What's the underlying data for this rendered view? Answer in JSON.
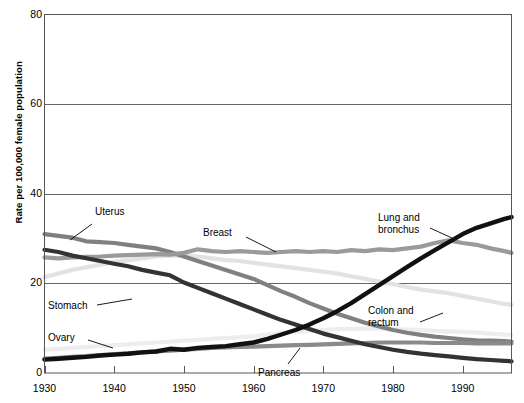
{
  "chart_data": {
    "type": "line",
    "title": "",
    "xlabel": "",
    "ylabel": "Rate per 100,000 female population",
    "xlim": [
      1930,
      1997
    ],
    "ylim": [
      0,
      80
    ],
    "grid": true,
    "legend_position": "inline-annotations",
    "xticks": [
      1930,
      1940,
      1950,
      1960,
      1970,
      1980,
      1990
    ],
    "yticks": [
      0,
      20,
      40,
      60,
      80
    ],
    "xtick_labels": [
      "1930",
      "1940",
      "1950",
      "1960",
      "1970",
      "1980",
      "1990"
    ],
    "ytick_labels": [
      "0",
      "20",
      "40",
      "60",
      "80"
    ],
    "x": [
      1930,
      1932,
      1934,
      1936,
      1938,
      1940,
      1942,
      1944,
      1946,
      1948,
      1950,
      1952,
      1954,
      1956,
      1958,
      1960,
      1962,
      1964,
      1966,
      1968,
      1970,
      1972,
      1974,
      1976,
      1978,
      1980,
      1982,
      1984,
      1986,
      1988,
      1990,
      1992,
      1994,
      1996,
      1997
    ],
    "series": [
      {
        "name": "Uterus",
        "color": "#808080",
        "width": 4.2,
        "values": [
          31.0,
          30.6,
          30.2,
          29.4,
          29.2,
          29.0,
          28.6,
          28.2,
          27.8,
          27.0,
          26.0,
          25.0,
          24.0,
          23.0,
          22.0,
          21.0,
          19.6,
          18.2,
          17.0,
          15.6,
          14.4,
          13.2,
          12.2,
          11.2,
          10.4,
          9.6,
          9.0,
          8.5,
          8.1,
          7.8,
          7.5,
          7.3,
          7.2,
          7.1,
          7.0
        ]
      },
      {
        "name": "Stomach",
        "color": "#333333",
        "width": 4.2,
        "values": [
          27.5,
          27.0,
          26.2,
          25.6,
          25.0,
          24.4,
          23.8,
          23.0,
          22.4,
          21.8,
          20.2,
          19.0,
          17.8,
          16.6,
          15.4,
          14.2,
          13.0,
          11.8,
          10.8,
          9.8,
          8.8,
          8.0,
          7.2,
          6.4,
          5.8,
          5.2,
          4.7,
          4.3,
          4.0,
          3.7,
          3.4,
          3.1,
          2.9,
          2.7,
          2.6
        ]
      },
      {
        "name": "Breast",
        "color": "#9a9a9a",
        "width": 4.2,
        "values": [
          25.8,
          25.6,
          25.8,
          25.9,
          26.0,
          26.2,
          26.3,
          26.4,
          26.5,
          26.4,
          26.8,
          27.6,
          27.2,
          27.0,
          27.2,
          27.0,
          26.8,
          27.0,
          27.2,
          27.0,
          27.2,
          27.0,
          27.4,
          27.2,
          27.6,
          27.4,
          27.8,
          28.2,
          29.0,
          29.6,
          29.0,
          28.6,
          27.8,
          27.2,
          26.8
        ]
      },
      {
        "name": "Colon and rectum",
        "color": "#e2e2e2",
        "width": 4.2,
        "values": [
          21.4,
          22.2,
          23.0,
          23.6,
          24.2,
          24.8,
          25.2,
          25.6,
          26.0,
          26.2,
          26.2,
          26.0,
          25.6,
          25.2,
          25.0,
          24.6,
          24.2,
          23.8,
          23.4,
          23.0,
          22.6,
          22.2,
          21.6,
          21.0,
          20.4,
          19.8,
          19.2,
          18.6,
          18.2,
          17.8,
          17.2,
          16.6,
          16.0,
          15.4,
          15.2
        ]
      },
      {
        "name": "Ovary",
        "color": "#ededed",
        "width": 4.2,
        "values": [
          5.2,
          5.4,
          5.6,
          5.8,
          6.0,
          6.2,
          6.4,
          6.6,
          6.8,
          7.0,
          7.2,
          7.4,
          7.6,
          7.8,
          8.0,
          8.2,
          8.6,
          9.0,
          9.2,
          9.4,
          9.6,
          9.8,
          9.8,
          9.9,
          9.9,
          9.8,
          9.7,
          9.6,
          9.4,
          9.3,
          9.2,
          9.0,
          8.8,
          8.6,
          8.5
        ]
      },
      {
        "name": "Pancreas",
        "color": "#8a8a8a",
        "width": 4.2,
        "values": [
          3.2,
          3.4,
          3.6,
          3.8,
          4.0,
          4.2,
          4.4,
          4.6,
          4.8,
          5.0,
          5.2,
          5.4,
          5.6,
          5.7,
          5.8,
          5.9,
          6.0,
          6.1,
          6.2,
          6.3,
          6.4,
          6.5,
          6.6,
          6.7,
          6.8,
          6.8,
          6.8,
          6.8,
          6.7,
          6.7,
          6.7,
          6.6,
          6.6,
          6.6,
          6.6
        ]
      },
      {
        "name": "Lung and bronchus",
        "color": "#111111",
        "width": 4.4,
        "values": [
          3.0,
          3.2,
          3.4,
          3.6,
          3.9,
          4.1,
          4.3,
          4.6,
          4.8,
          5.4,
          5.2,
          5.6,
          5.8,
          6.0,
          6.4,
          6.8,
          7.6,
          8.6,
          9.6,
          10.8,
          12.2,
          13.8,
          15.6,
          17.6,
          19.6,
          21.6,
          23.6,
          25.6,
          27.4,
          29.2,
          31.0,
          32.4,
          33.4,
          34.4,
          34.8
        ]
      }
    ],
    "annotations": [
      {
        "name": "uterus",
        "label": "Uterus",
        "x": 95,
        "y": 206,
        "leader": [
          [
            92,
            224
          ],
          [
            70,
            240
          ]
        ]
      },
      {
        "name": "breast",
        "label": "Breast",
        "x": 203,
        "y": 227,
        "leader": [
          [
            246,
            237
          ],
          [
            276,
            252
          ]
        ]
      },
      {
        "name": "lung-and-bronchus",
        "label": "Lung and\nbronchus",
        "x": 378,
        "y": 212,
        "leader": [
          [
            430,
            228
          ],
          [
            452,
            238
          ]
        ]
      },
      {
        "name": "stomach",
        "label": "Stomach",
        "x": 48,
        "y": 300,
        "leader": [
          [
            97,
            305
          ],
          [
            132,
            299
          ]
        ]
      },
      {
        "name": "colon-and-rectum",
        "label": "Colon and\nrectum",
        "x": 368,
        "y": 305,
        "leader": [
          [
            420,
            322
          ],
          [
            443,
            313
          ]
        ]
      },
      {
        "name": "ovary",
        "label": "Ovary",
        "x": 48,
        "y": 332,
        "leader": [
          [
            88,
            340
          ],
          [
            113,
            348
          ]
        ]
      },
      {
        "name": "pancreas",
        "label": "Pancreas",
        "x": 258,
        "y": 367,
        "leader": [
          [
            288,
            364
          ],
          [
            300,
            348
          ]
        ]
      }
    ]
  },
  "axes": {
    "frame_color": "#555555",
    "grid_color": "#666666",
    "background": "#ffffff"
  }
}
